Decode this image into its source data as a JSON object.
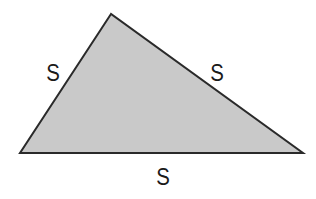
{
  "diagram": {
    "title": "",
    "shape": "triangle",
    "fill_color": "#c9c9c9",
    "stroke_color": "#2a2a2a",
    "vertices": [
      [
        111,
        14
      ],
      [
        20,
        153
      ],
      [
        303,
        153
      ]
    ],
    "labels": {
      "left_side": "S",
      "right_side": "S",
      "bottom_side": "S"
    }
  }
}
